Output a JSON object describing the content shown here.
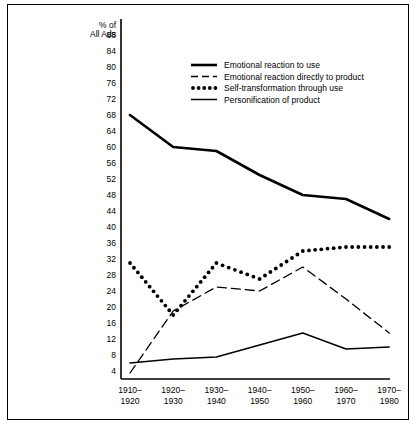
{
  "figure": {
    "frame_color": "#000000",
    "background": "#ffffff"
  },
  "axis": {
    "y_title_line1": "% of",
    "y_title_line2": "All Ads"
  },
  "legend": {
    "entries": [
      {
        "label": "Emotional reaction to use",
        "style": "thick-solid",
        "swatch_name": "legend-swatch-thick-solid"
      },
      {
        "label": "Emotional reaction directly to product",
        "style": "dashed",
        "swatch_name": "legend-swatch-dashed"
      },
      {
        "label": "Self-transformation through use",
        "style": "dotted",
        "swatch_name": "legend-swatch-dotted"
      },
      {
        "label": "Personification of product",
        "style": "thin-solid",
        "swatch_name": "legend-swatch-thin-solid"
      }
    ]
  },
  "chart_data": {
    "type": "line",
    "title": "",
    "xlabel": "",
    "ylabel": "% of All Ads",
    "categories": [
      "1910–\n1920",
      "1920–\n1930",
      "1930–\n1940",
      "1940–\n1950",
      "1950–\n1960",
      "1960–\n1970",
      "1970–\n1980"
    ],
    "yticks": [
      4,
      8,
      12,
      16,
      20,
      24,
      28,
      32,
      36,
      40,
      44,
      48,
      52,
      56,
      60,
      64,
      68,
      72,
      76,
      80,
      84,
      88
    ],
    "ylim": [
      0,
      90
    ],
    "grid": false,
    "legend_position": "top-right-inside",
    "series": [
      {
        "name": "Emotional reaction to use",
        "style": "thick-solid",
        "values": [
          68,
          60,
          59,
          53,
          48,
          47,
          42
        ]
      },
      {
        "name": "Emotional reaction directly to product",
        "style": "dashed",
        "values": [
          3.5,
          19,
          25,
          24,
          30,
          22,
          13.5
        ]
      },
      {
        "name": "Self-transformation through use",
        "style": "dotted",
        "values": [
          31,
          18,
          31,
          27,
          34,
          35,
          35
        ]
      },
      {
        "name": "Personification of product",
        "style": "thin-solid",
        "values": [
          6,
          7,
          7.5,
          10.5,
          13.5,
          9.5,
          10
        ]
      }
    ]
  }
}
